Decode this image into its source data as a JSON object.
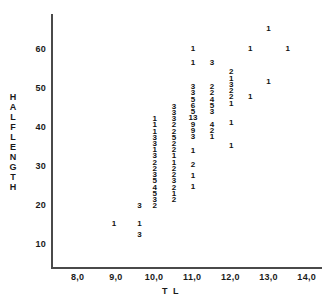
{
  "chart_data": {
    "type": "scatter",
    "title": "",
    "xlabel": "T L",
    "ylabel": "HALFLENGTH",
    "xlim": [
      7.3,
      14.4
    ],
    "ylim": [
      4.0,
      69.0
    ],
    "grid": false,
    "legend": null,
    "xticks": [
      "8,0",
      "9,0",
      "10,0",
      "11,0",
      "12,0",
      "13,0",
      "14,0"
    ],
    "xtick_values": [
      8.0,
      9.0,
      10.0,
      11.0,
      12.0,
      13.0,
      14.0
    ],
    "yticks": [
      "60",
      "50",
      "40",
      "30",
      "20",
      "10"
    ],
    "ytick_values": [
      60,
      50,
      40,
      30,
      20,
      10
    ],
    "points": [
      {
        "x": 8.95,
        "y": 15.0,
        "count": "1"
      },
      {
        "x": 9.62,
        "y": 19.8,
        "count": "3"
      },
      {
        "x": 9.62,
        "y": 15.0,
        "count": "1"
      },
      {
        "x": 9.62,
        "y": 12.2,
        "count": "3"
      },
      {
        "x": 10.02,
        "y": 42.0,
        "count": "1"
      },
      {
        "x": 10.02,
        "y": 40.4,
        "count": "1"
      },
      {
        "x": 10.02,
        "y": 38.8,
        "count": "1"
      },
      {
        "x": 10.02,
        "y": 37.2,
        "count": "3"
      },
      {
        "x": 10.02,
        "y": 35.6,
        "count": "3"
      },
      {
        "x": 10.02,
        "y": 34.0,
        "count": "1"
      },
      {
        "x": 10.02,
        "y": 32.4,
        "count": "3"
      },
      {
        "x": 10.02,
        "y": 30.8,
        "count": "2"
      },
      {
        "x": 10.02,
        "y": 29.2,
        "count": "2"
      },
      {
        "x": 10.02,
        "y": 27.6,
        "count": "3"
      },
      {
        "x": 10.02,
        "y": 26.0,
        "count": "5"
      },
      {
        "x": 10.02,
        "y": 24.4,
        "count": "4"
      },
      {
        "x": 10.02,
        "y": 22.8,
        "count": "5"
      },
      {
        "x": 10.02,
        "y": 21.2,
        "count": "3"
      },
      {
        "x": 10.02,
        "y": 19.6,
        "count": "2"
      },
      {
        "x": 10.52,
        "y": 45.2,
        "count": "3"
      },
      {
        "x": 10.52,
        "y": 43.6,
        "count": "3"
      },
      {
        "x": 10.52,
        "y": 42.0,
        "count": "3"
      },
      {
        "x": 10.52,
        "y": 40.4,
        "count": "2"
      },
      {
        "x": 10.52,
        "y": 38.8,
        "count": "2"
      },
      {
        "x": 10.52,
        "y": 37.2,
        "count": "5"
      },
      {
        "x": 10.52,
        "y": 35.6,
        "count": "2"
      },
      {
        "x": 10.52,
        "y": 34.0,
        "count": "2"
      },
      {
        "x": 10.52,
        "y": 32.4,
        "count": "1"
      },
      {
        "x": 10.52,
        "y": 30.8,
        "count": "1"
      },
      {
        "x": 10.52,
        "y": 29.2,
        "count": "2"
      },
      {
        "x": 10.52,
        "y": 27.6,
        "count": "2"
      },
      {
        "x": 10.52,
        "y": 26.0,
        "count": "3"
      },
      {
        "x": 10.52,
        "y": 24.4,
        "count": "2"
      },
      {
        "x": 10.52,
        "y": 22.8,
        "count": "1"
      },
      {
        "x": 10.52,
        "y": 21.2,
        "count": "2"
      },
      {
        "x": 11.02,
        "y": 60.0,
        "count": "1"
      },
      {
        "x": 11.02,
        "y": 56.5,
        "count": "1"
      },
      {
        "x": 11.02,
        "y": 50.2,
        "count": "3"
      },
      {
        "x": 11.02,
        "y": 48.6,
        "count": "3"
      },
      {
        "x": 11.02,
        "y": 47.0,
        "count": "5"
      },
      {
        "x": 11.02,
        "y": 45.4,
        "count": "6"
      },
      {
        "x": 11.02,
        "y": 43.8,
        "count": "5"
      },
      {
        "x": 11.02,
        "y": 42.2,
        "count": "13"
      },
      {
        "x": 11.02,
        "y": 40.6,
        "count": "9"
      },
      {
        "x": 11.02,
        "y": 39.0,
        "count": "9"
      },
      {
        "x": 11.02,
        "y": 37.4,
        "count": "3"
      },
      {
        "x": 11.02,
        "y": 33.8,
        "count": "1"
      },
      {
        "x": 11.02,
        "y": 30.2,
        "count": "2"
      },
      {
        "x": 11.02,
        "y": 27.4,
        "count": "1"
      },
      {
        "x": 11.02,
        "y": 24.6,
        "count": "1"
      },
      {
        "x": 11.52,
        "y": 56.5,
        "count": "3"
      },
      {
        "x": 11.52,
        "y": 50.2,
        "count": "2"
      },
      {
        "x": 11.52,
        "y": 48.6,
        "count": "2"
      },
      {
        "x": 11.52,
        "y": 47.0,
        "count": "4"
      },
      {
        "x": 11.52,
        "y": 45.4,
        "count": "5"
      },
      {
        "x": 11.52,
        "y": 43.8,
        "count": "3"
      },
      {
        "x": 11.52,
        "y": 40.6,
        "count": "4"
      },
      {
        "x": 11.52,
        "y": 39.0,
        "count": "2"
      },
      {
        "x": 11.52,
        "y": 37.4,
        "count": "1"
      },
      {
        "x": 12.02,
        "y": 54.0,
        "count": "2"
      },
      {
        "x": 12.02,
        "y": 52.4,
        "count": "1"
      },
      {
        "x": 12.02,
        "y": 50.8,
        "count": "3"
      },
      {
        "x": 12.02,
        "y": 49.2,
        "count": "2"
      },
      {
        "x": 12.02,
        "y": 47.6,
        "count": "2"
      },
      {
        "x": 12.02,
        "y": 46.0,
        "count": "1"
      },
      {
        "x": 12.02,
        "y": 41.0,
        "count": "1"
      },
      {
        "x": 12.02,
        "y": 35.0,
        "count": "1"
      },
      {
        "x": 12.52,
        "y": 60.0,
        "count": "1"
      },
      {
        "x": 12.52,
        "y": 47.8,
        "count": "1"
      },
      {
        "x": 13.0,
        "y": 65.2,
        "count": "1"
      },
      {
        "x": 13.0,
        "y": 51.6,
        "count": "1"
      },
      {
        "x": 13.5,
        "y": 60.0,
        "count": "1"
      }
    ]
  }
}
